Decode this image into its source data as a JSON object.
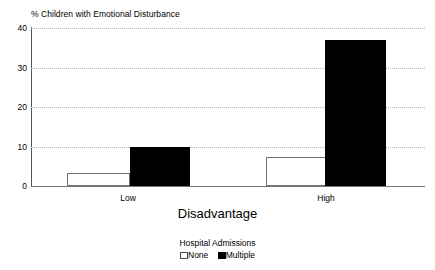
{
  "chart_data": {
    "type": "bar",
    "title": "% Children with Emotional Disturbance",
    "xlabel": "Disadvantage",
    "ylabel": "",
    "categories": [
      "Low",
      "High"
    ],
    "series": [
      {
        "name": "None",
        "values": [
          3.3,
          7.4
        ],
        "color": "#ffffff"
      },
      {
        "name": "Multiple",
        "values": [
          10.0,
          37.0
        ],
        "color": "#000000"
      }
    ],
    "ylim": [
      0,
      40
    ],
    "yticks": [
      0,
      10,
      20,
      30,
      40
    ],
    "ytick_labels": [
      "0",
      "10",
      "20",
      "30",
      "40"
    ],
    "grid": true,
    "grid_axis": "y",
    "grid_style": "dotted",
    "legend": {
      "title": "Hospital Admissions",
      "position": "bottom-center",
      "entries": [
        {
          "label": "None",
          "swatch": "white-outlined"
        },
        {
          "label": "Multiple",
          "swatch": "black-filled"
        }
      ]
    }
  },
  "colors": {
    "background": "#ffffff",
    "foreground": "#000000",
    "gridline": "#b9b9b9",
    "axis": "#555555",
    "bar_none_fill": "#ffffff",
    "bar_none_stroke": "#6e6e6e",
    "bar_multiple_fill": "#000000"
  }
}
